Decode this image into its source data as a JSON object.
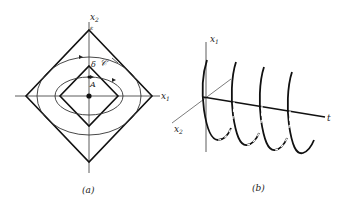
{
  "panel_a": {
    "caption": "(a)",
    "axis_x_label": "x",
    "axis_x_sub": "1",
    "axis_y_label": "x",
    "axis_y_sub": "2",
    "label_epsilon": "ε",
    "label_delta": "δ",
    "label_curve": "𝒞",
    "label_point": "A"
  },
  "panel_b": {
    "caption": "(b)",
    "axis_x1_label": "x",
    "axis_x1_sub": "1",
    "axis_x2_label": "x",
    "axis_x2_sub": "2",
    "axis_t_label": "t"
  }
}
